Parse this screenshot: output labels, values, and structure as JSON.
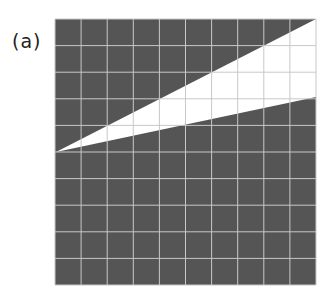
{
  "figure": {
    "label": "(a)",
    "grid": {
      "cols": 10,
      "rows": 10,
      "x0": 55,
      "y0": 19,
      "x1": 316,
      "y1": 285
    },
    "colors": {
      "fill": "#555555",
      "grid_line": "#c8c8c8",
      "wedge": "#ffffff"
    },
    "wedge": {
      "apex": [
        56,
        152
      ],
      "upper_right": [
        316,
        19
      ],
      "lower_right": [
        316,
        97
      ]
    }
  }
}
